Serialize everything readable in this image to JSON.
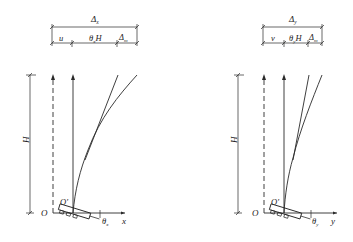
{
  "diagrams": [
    {
      "id": "x-direction",
      "top_dimension": {
        "label": "Δx",
        "main": "Δ",
        "sub": "x"
      },
      "segments": [
        {
          "label": "u",
          "main": "u",
          "sub": ""
        },
        {
          "label": "θxH",
          "main": "θ",
          "sub": "x",
          "tail": "H"
        },
        {
          "label": "Δm",
          "main": "Δ",
          "sub": "m"
        }
      ],
      "height_label": "H",
      "origin_label": "O",
      "rotated_origin_label": "O'",
      "axis_label": "x",
      "rotation_label": {
        "main": "θ",
        "sub": "x"
      }
    },
    {
      "id": "y-direction",
      "top_dimension": {
        "label": "Δy",
        "main": "Δ",
        "sub": "y"
      },
      "segments": [
        {
          "label": "v",
          "main": "v",
          "sub": ""
        },
        {
          "label": "θyH",
          "main": "θ",
          "sub": "y",
          "tail": "H"
        },
        {
          "label": "Δm",
          "main": "Δ",
          "sub": "m"
        }
      ],
      "height_label": "H",
      "origin_label": "O",
      "rotated_origin_label": "O'",
      "axis_label": "y",
      "rotation_label": {
        "main": "θ",
        "sub": "y"
      }
    }
  ],
  "colors": {
    "line": "#2a2a2a",
    "background": "#ffffff"
  }
}
